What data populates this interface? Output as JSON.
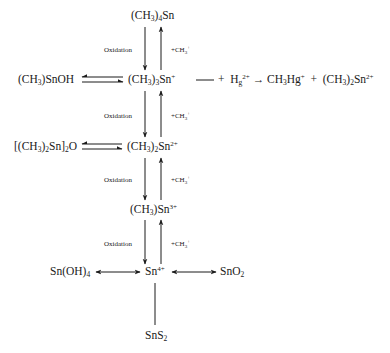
{
  "diagram": {
    "nodes": {
      "tetramethyltin": {
        "prefix": "(CH",
        "sub1": "3",
        "mid": ")",
        "sub2": "4",
        "suffix": "Sn"
      },
      "methyltin_hydroxide": {
        "prefix": "(CH",
        "sub1": "3",
        "suffix": ")SnOH"
      },
      "trimethyltin": {
        "prefix": "(CH",
        "sub1": "3",
        "mid": ")",
        "sub2": "3",
        "suffix": "Sn",
        "charge": "+"
      },
      "dimethyltin_oxide": {
        "prefix": "[(CH",
        "sub1": "3",
        "mid": ")",
        "sub2": "2",
        "mid2": "Sn]",
        "sub3": "2",
        "suffix": "O"
      },
      "dimethyltin": {
        "prefix": "(CH",
        "sub1": "3",
        "mid": ")",
        "sub2": "2",
        "suffix": "Sn",
        "charge": "2+"
      },
      "methyltin": {
        "prefix": "(CH",
        "sub1": "3",
        "suffix": ")Sn",
        "charge": "3+"
      },
      "tin_hydroxide": {
        "prefix": "Sn(OH)",
        "sub1": "4"
      },
      "tin_ion": {
        "prefix": "Sn",
        "charge": "4+"
      },
      "tin_dioxide": {
        "prefix": "SnO",
        "sub1": "2"
      },
      "tin_disulfide": {
        "prefix": "SnS",
        "sub1": "2"
      }
    },
    "mercury_reaction": {
      "plus1": "+",
      "hg": "H",
      "hg_sub": "g",
      "hg_charge": "2+",
      "arrow": "→",
      "product1_prefix": "CH",
      "product1_sub": "3",
      "product1_suffix": "Hg",
      "product1_charge": "+",
      "plus2": "+",
      "product2_prefix": "(CH",
      "product2_sub1": "3",
      "product2_mid": ")",
      "product2_sub2": "2",
      "product2_suffix": "Sn",
      "product2_charge": "2+"
    },
    "edge_labels": {
      "oxidation": "Oxidation",
      "methylation_prefix": "+CH",
      "methylation_sub": "3",
      "methylation_charge": "+"
    }
  }
}
